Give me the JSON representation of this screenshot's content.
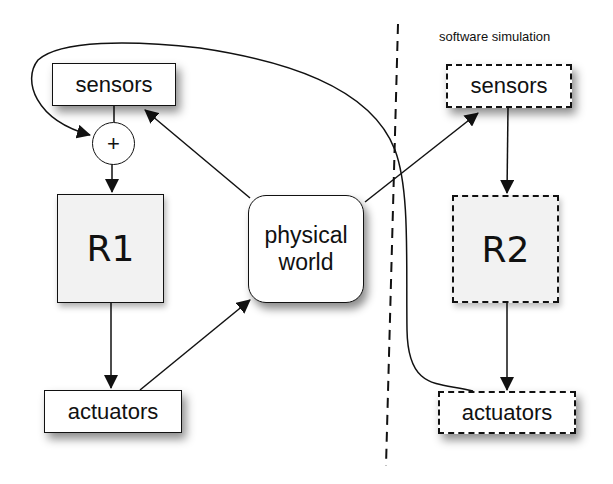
{
  "diagram": {
    "region_label": "software simulation",
    "left": {
      "sensors_label": "sensors",
      "sum_label": "+",
      "controller_label": "R1",
      "actuators_label": "actuators"
    },
    "center": {
      "world_label_line1": "physical",
      "world_label_line2": "world"
    },
    "right": {
      "sensors_label": "sensors",
      "controller_label": "R2",
      "actuators_label": "actuators"
    },
    "edges": [
      {
        "from": "sensors-left",
        "to": "sum"
      },
      {
        "from": "sum",
        "to": "R1"
      },
      {
        "from": "R1",
        "to": "actuators-left"
      },
      {
        "from": "actuators-left",
        "to": "physical-world"
      },
      {
        "from": "physical-world",
        "to": "sensors-left"
      },
      {
        "from": "physical-world",
        "to": "sensors-right"
      },
      {
        "from": "sensors-right",
        "to": "R2"
      },
      {
        "from": "R2",
        "to": "actuators-right"
      },
      {
        "from": "actuators-right",
        "to": "sum",
        "style": "curved"
      }
    ],
    "colors": {
      "stroke": "#111111",
      "controller_fill": "#f2f2f2",
      "background": "#ffffff"
    }
  }
}
